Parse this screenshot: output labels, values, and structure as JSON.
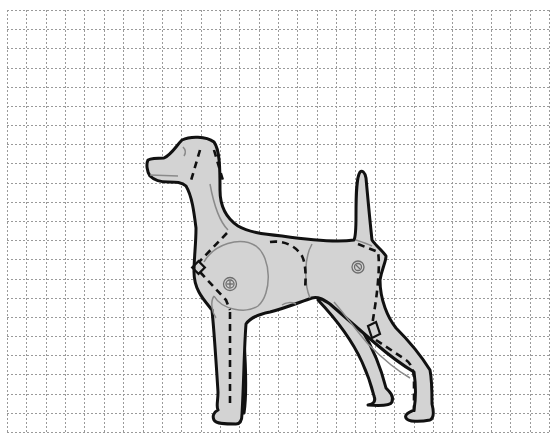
{
  "figure": {
    "background_color": "#ffffff",
    "body_color": "#d3d3d3",
    "outline_color": "#111111",
    "grid": {
      "style": "dotted",
      "color": "#9a9a9a",
      "x_start": 7,
      "x_end": 549,
      "y_start": 10,
      "y_end": 432,
      "columns": 28,
      "rows": 22
    },
    "markers": [
      {
        "name": "shoulder-joint",
        "symbol": "circled-plus",
        "x": 230,
        "y": 284
      },
      {
        "name": "hip-joint",
        "symbol": "circled-x",
        "x": 358,
        "y": 267
      },
      {
        "name": "chest-square",
        "symbol": "square",
        "x": 199,
        "y": 268
      },
      {
        "name": "hock-square",
        "symbol": "square",
        "x": 372,
        "y": 332
      }
    ]
  }
}
